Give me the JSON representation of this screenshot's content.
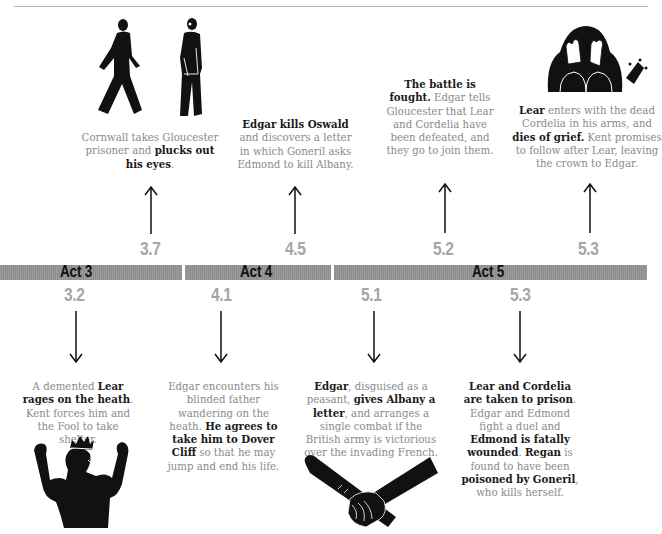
{
  "acts": [
    {
      "label": "Act 3"
    },
    {
      "label": "Act 4"
    },
    {
      "label": "Act 5"
    }
  ],
  "above_events": [
    {
      "scene": "3.7",
      "icon": "gloucester-led-prisoner-icon",
      "parts": [
        "Cornwall takes Gloucester prisoner and ",
        "plucks out his eyes",
        "."
      ]
    },
    {
      "scene": "4.5",
      "parts": [
        "Edgar kills Oswald",
        " and discovers a letter in which Goneril asks Edmond to kill Albany."
      ]
    },
    {
      "scene": "5.2",
      "parts": [
        "The battle is fought.",
        " Edgar tells Gloucester that Lear and Cordelia have been defeated, and they go to join them."
      ]
    },
    {
      "scene": "5.3",
      "icon": "grieving-lear-crown-icon",
      "parts": [
        "Lear",
        " enters with the dead Cordelia in his arms, and ",
        "dies of grief.",
        " Kent promises to follow after Lear, leaving the crown to Edgar."
      ]
    }
  ],
  "below_events": [
    {
      "scene": "3.2",
      "icon": "raging-lear-crown-icon",
      "parts": [
        "A demented ",
        "Lear rages on the heath",
        ". Kent forces him and the Fool to take shelter."
      ]
    },
    {
      "scene": "4.1",
      "parts": [
        "Edgar encounters his blinded father wandering on the heath. ",
        "He agrees to take him to Dover Cliff",
        " so that he may jump and end his life."
      ]
    },
    {
      "scene": "5.1",
      "icon": "hand-letter-scroll-icon",
      "parts": [
        "Edgar",
        ", disguised as a peasant, ",
        "gives Albany a letter",
        ", and arranges a single combat if the British army is victorious over the invading French."
      ]
    },
    {
      "scene": "5.3",
      "parts": [
        "Lear and Cordelia are taken to prison",
        ". Edgar and Edmond fight a duel and ",
        "Edmond is fatally wounded",
        ". ",
        "Regan",
        " is found to have been ",
        "poisoned by Goneril",
        ", who kills herself."
      ]
    }
  ],
  "colors": {
    "bar": "#959595",
    "scene_number": "#a6a6a6",
    "body_text": "#8a8a8a",
    "bold_text": "#1a1a1a"
  }
}
